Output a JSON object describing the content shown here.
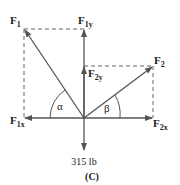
{
  "diagram": {
    "caption": "(C)",
    "load_label": "315 lb",
    "vectors": {
      "F1": {
        "label": "F",
        "sub": "1"
      },
      "F1y": {
        "label": "F",
        "sub": "1y"
      },
      "F1x": {
        "label": "F",
        "sub": "1x"
      },
      "F2": {
        "label": "F",
        "sub": "2"
      },
      "F2y": {
        "label": "F",
        "sub": "2y"
      },
      "F2x": {
        "label": "F",
        "sub": "2x"
      }
    },
    "angles": {
      "alpha": "α",
      "beta": "β"
    },
    "colors": {
      "arrow": "#555555",
      "dashed": "#666666",
      "text": "#222222"
    }
  }
}
